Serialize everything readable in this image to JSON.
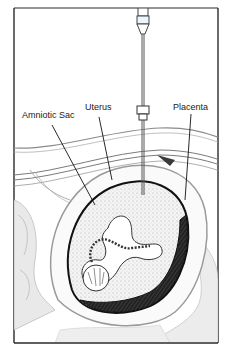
{
  "diagram": {
    "labels": {
      "amniotic_sac": "Amniotic Sac",
      "uterus": "Uterus",
      "placenta": "Placenta"
    },
    "components": [
      "needle",
      "needle-hub",
      "abdominal-wall",
      "uterus",
      "amniotic-sac",
      "fetus",
      "umbilical-cord",
      "placenta"
    ],
    "colors": {
      "background": "#ffffff",
      "frame": "#2a2a2a",
      "ink": "#111111",
      "tissue_shade": "#cfcfcf",
      "placenta_dark": "#141414"
    }
  }
}
